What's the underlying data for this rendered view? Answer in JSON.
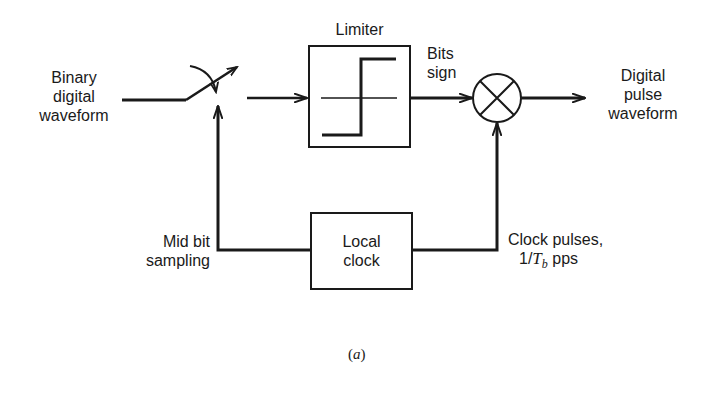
{
  "diagram": {
    "type": "block-diagram",
    "caption": "(a)",
    "caption_inner": "a",
    "colors": {
      "stroke": "#1a1a1a",
      "background": "#ffffff"
    },
    "nodes": {
      "input": {
        "label_lines": [
          "Binary",
          "digital",
          "waveform"
        ]
      },
      "switch": {
        "label": "",
        "kind": "sampling-switch"
      },
      "limiter": {
        "label": "Limiter",
        "kind": "hard-limiter-box"
      },
      "multiplier": {
        "label": "",
        "kind": "multiplier-circle"
      },
      "output": {
        "label_lines": [
          "Digital",
          "pulse",
          "waveform"
        ]
      },
      "local_clock": {
        "label_lines": [
          "Local",
          "clock"
        ]
      }
    },
    "edge_labels": {
      "bits_sign": [
        "Bits",
        "sign"
      ],
      "mid_bit_sampling": [
        "Mid bit",
        "sampling"
      ],
      "clock_pulses_line1": "Clock pulses,",
      "clock_pulses_prefix": "1/",
      "clock_pulses_var": "T",
      "clock_pulses_sub": "b",
      "clock_pulses_suffix": " pps"
    },
    "edges": [
      {
        "from": "input",
        "to": "switch"
      },
      {
        "from": "switch",
        "to": "limiter"
      },
      {
        "from": "limiter",
        "to": "multiplier",
        "label": "Bits sign"
      },
      {
        "from": "multiplier",
        "to": "output"
      },
      {
        "from": "local_clock",
        "to": "switch",
        "label": "Mid bit sampling"
      },
      {
        "from": "local_clock",
        "to": "multiplier",
        "label": "Clock pulses, 1/Tb pps"
      }
    ]
  }
}
